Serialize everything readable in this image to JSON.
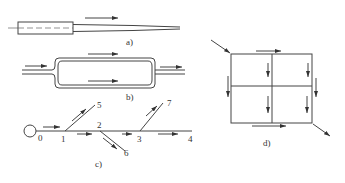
{
  "figure": {
    "panels": [
      {
        "id": "a",
        "caption": "a)",
        "description": "Single pipe with reducing diameter, flow left to right"
      },
      {
        "id": "b",
        "caption": "b)",
        "description": "Parallel pipes forming a loop, flow splits and merges"
      },
      {
        "id": "c",
        "caption": "c)",
        "description": "Branched pipeline from source node 0 with nodes 1–7"
      },
      {
        "id": "d",
        "caption": "d)",
        "description": "Looped grid network, inflow top-left, outflow bottom-right"
      }
    ],
    "panel_c": {
      "nodes": [
        "0",
        "1",
        "2",
        "3",
        "4",
        "5",
        "6",
        "7"
      ]
    }
  },
  "colors": {
    "line": "#444444",
    "background": "#ffffff"
  }
}
